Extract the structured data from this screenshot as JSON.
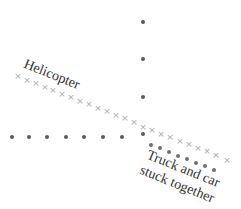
{
  "diagram": {
    "type": "motion diagram / collision strobe",
    "labels": {
      "helicopter": "Helicopter",
      "truck_car_line1": "Truck and car",
      "truck_car_line2": "stuck together"
    },
    "colors": {
      "dot": "#5a5a5a",
      "xmark": "#a8a8a8",
      "text": "#333333",
      "background": "#ffffff"
    },
    "series": {
      "vertical_dots": [
        [
          143,
          22
        ],
        [
          143,
          59
        ],
        [
          143,
          97
        ],
        [
          143,
          134
        ]
      ],
      "horizontal_dots": [
        [
          12,
          137
        ],
        [
          29,
          137
        ],
        [
          47,
          137
        ],
        [
          66,
          137
        ],
        [
          84,
          137
        ],
        [
          103,
          137
        ],
        [
          122,
          137
        ]
      ],
      "helicopter_xmarks": [
        [
          18,
          76
        ],
        [
          27,
          80
        ],
        [
          36,
          83
        ],
        [
          45,
          87
        ],
        [
          53,
          90
        ],
        [
          62,
          94
        ],
        [
          71,
          97
        ],
        [
          80,
          101
        ],
        [
          89,
          104
        ],
        [
          98,
          108
        ],
        [
          107,
          111
        ],
        [
          116,
          115
        ],
        [
          125,
          118
        ],
        [
          134,
          122
        ],
        [
          143,
          127
        ],
        [
          152,
          130
        ],
        [
          161,
          134
        ],
        [
          170,
          137
        ],
        [
          180,
          141
        ],
        [
          189,
          144
        ],
        [
          198,
          148
        ],
        [
          207,
          151
        ],
        [
          216,
          155
        ],
        [
          227,
          160
        ]
      ],
      "truck_car_dots": [
        [
          151,
          145
        ],
        [
          160,
          148
        ],
        [
          169,
          152
        ],
        [
          178,
          156
        ],
        [
          187,
          159
        ],
        [
          196,
          163
        ],
        [
          205,
          166
        ],
        [
          214,
          170
        ]
      ]
    }
  }
}
